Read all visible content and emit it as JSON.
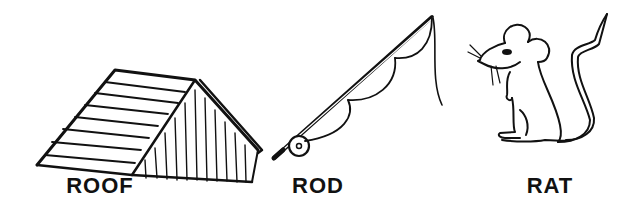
{
  "items": [
    {
      "name": "roof",
      "label": "ROOF",
      "icon": "roof-icon"
    },
    {
      "name": "rod",
      "label": "ROD",
      "icon": "fishing-rod-icon"
    },
    {
      "name": "rat",
      "label": "RAT",
      "icon": "rat-icon"
    }
  ],
  "colors": {
    "ink": "#111111",
    "background": "#ffffff"
  }
}
